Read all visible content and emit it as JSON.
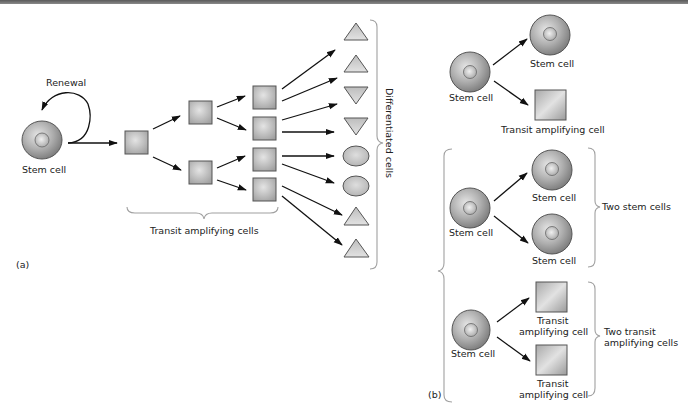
{
  "panel_a": {
    "tag": "(a)",
    "renewal_label": "Renewal",
    "stem_label": "Stem cell",
    "transit_label": "Transit amplifying cells",
    "differentiated_label": "Differentiated  cells"
  },
  "panel_b": {
    "tag": "(b)",
    "asym": {
      "parent": "Stem cell",
      "child_top": "Stem cell",
      "child_bottom": "Transit amplifying cell"
    },
    "sym_stem": {
      "parent": "Stem cell",
      "child_top": "Stem cell",
      "child_bottom": "Stem cell",
      "group_label": "Two stem cells"
    },
    "sym_transit": {
      "parent": "Stem cell",
      "child_top_line1": "Transit",
      "child_top_line2": "amplifying cell",
      "child_bottom_line1": "Transit",
      "child_bottom_line2": "amplifying cell",
      "group_label_line1": "Two transit",
      "group_label_line2": "amplifying cells"
    }
  },
  "colors": {
    "cell_outer": "#9a9a9a",
    "cell_highlight": "#e8e8e8",
    "shape_fill": "#c8c8c8",
    "brace": "#a0a0a0",
    "arrow": "#111111"
  }
}
